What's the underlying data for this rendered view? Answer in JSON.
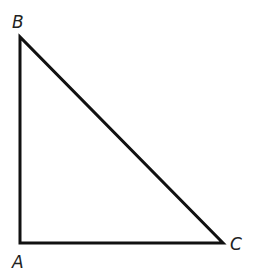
{
  "diagram": {
    "type": "right-triangle",
    "stroke_color": "#111111",
    "stroke_width": 3,
    "vertices": [
      {
        "name": "A",
        "x": 20,
        "y": 243,
        "label": "A",
        "label_x": 12,
        "label_y": 268
      },
      {
        "name": "B",
        "x": 20,
        "y": 37,
        "label": "B",
        "label_x": 12,
        "label_y": 28
      },
      {
        "name": "C",
        "x": 223,
        "y": 243,
        "label": "C",
        "label_x": 230,
        "label_y": 250
      }
    ],
    "right_angle_at": "A",
    "sides": [
      {
        "from": "A",
        "to": "B"
      },
      {
        "from": "B",
        "to": "C"
      },
      {
        "from": "C",
        "to": "A"
      }
    ]
  }
}
